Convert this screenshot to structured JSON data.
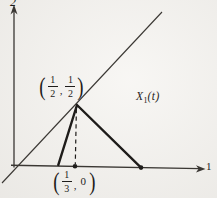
{
  "axes": {
    "y_axis_label": "2",
    "x_axis_label": "1"
  },
  "point_labels": {
    "peak": {
      "open_paren": "(",
      "x_numerator": "1",
      "x_denominator": "2",
      "separator": ",",
      "y_numerator": "1",
      "y_denominator": "2",
      "close_paren": ")"
    },
    "base": {
      "open_paren": "(",
      "x_numerator": "1",
      "x_denominator": "3",
      "separator": ",",
      "y_value": "0",
      "close_paren": ")"
    }
  },
  "function_label": {
    "variable": "X",
    "subscript": "1",
    "argument": "(t)"
  },
  "colors": {
    "background": "#f4f2ee",
    "line": "#3a3733",
    "heavy_line": "#1e1c1a"
  }
}
